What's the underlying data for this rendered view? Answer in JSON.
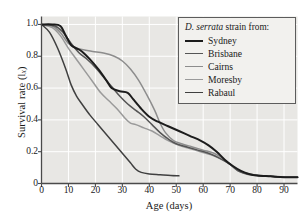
{
  "chart_data": {
    "type": "line",
    "title": "",
    "xlabel": "Age (days)",
    "ylabel": "Survival rate (l",
    "ylabel_sub": "x",
    "ylabel_suffix": ")",
    "xlim": [
      0,
      95
    ],
    "ylim": [
      0,
      1.05
    ],
    "xticks": [
      0,
      10,
      20,
      30,
      40,
      50,
      60,
      70,
      80,
      90
    ],
    "yticks": [
      0,
      0.2,
      0.4,
      0.6,
      0.8,
      1.0
    ],
    "ytick_labels": [
      "0",
      "0.2",
      "0.4",
      "0.6",
      "0.8",
      "1.0"
    ],
    "xtick_labels": [
      "0",
      "10",
      "20",
      "30",
      "40",
      "50",
      "60",
      "70",
      "80",
      "90"
    ],
    "grid": true,
    "grid_color": "#ffffff",
    "plot_background": "#e8e7e4",
    "legend_position": "upper-right",
    "series": [
      {
        "name": "Sydney",
        "color": "#1c1c1c",
        "width": 2.0,
        "points": [
          [
            0,
            1.0
          ],
          [
            4,
            1.0
          ],
          [
            7,
            0.99
          ],
          [
            9,
            0.93
          ],
          [
            11,
            0.87
          ],
          [
            13,
            0.85
          ],
          [
            15,
            0.83
          ],
          [
            18,
            0.78
          ],
          [
            21,
            0.72
          ],
          [
            24,
            0.65
          ],
          [
            26,
            0.6
          ],
          [
            29,
            0.58
          ],
          [
            32,
            0.57
          ],
          [
            34,
            0.53
          ],
          [
            37,
            0.47
          ],
          [
            40,
            0.42
          ],
          [
            43,
            0.39
          ],
          [
            47,
            0.36
          ],
          [
            51,
            0.33
          ],
          [
            55,
            0.3
          ],
          [
            59,
            0.27
          ],
          [
            62,
            0.24
          ],
          [
            65,
            0.2
          ],
          [
            68,
            0.15
          ],
          [
            71,
            0.11
          ],
          [
            74,
            0.08
          ],
          [
            77,
            0.06
          ],
          [
            80,
            0.05
          ],
          [
            85,
            0.045
          ],
          [
            90,
            0.04
          ],
          [
            95,
            0.04
          ]
        ]
      },
      {
        "name": "Brisbane",
        "color": "#555555",
        "width": 1.5,
        "points": [
          [
            0,
            1.0
          ],
          [
            5,
            0.99
          ],
          [
            8,
            0.95
          ],
          [
            11,
            0.88
          ],
          [
            14,
            0.82
          ],
          [
            17,
            0.78
          ],
          [
            20,
            0.73
          ],
          [
            23,
            0.67
          ],
          [
            26,
            0.61
          ],
          [
            29,
            0.55
          ],
          [
            32,
            0.5
          ],
          [
            35,
            0.46
          ],
          [
            38,
            0.42
          ],
          [
            41,
            0.37
          ],
          [
            44,
            0.32
          ],
          [
            47,
            0.28
          ],
          [
            50,
            0.25
          ],
          [
            54,
            0.23
          ],
          [
            58,
            0.21
          ],
          [
            62,
            0.19
          ],
          [
            66,
            0.16
          ],
          [
            70,
            0.12
          ],
          [
            73,
            0.08
          ],
          [
            76,
            0.06
          ],
          [
            80,
            0.05
          ],
          [
            85,
            0.045
          ],
          [
            90,
            0.04
          ],
          [
            95,
            0.04
          ]
        ]
      },
      {
        "name": "Cairns",
        "color": "#8d8d8d",
        "width": 1.5,
        "points": [
          [
            0,
            1.0
          ],
          [
            4,
            0.99
          ],
          [
            7,
            0.95
          ],
          [
            10,
            0.88
          ],
          [
            13,
            0.85
          ],
          [
            16,
            0.84
          ],
          [
            19,
            0.83
          ],
          [
            23,
            0.82
          ],
          [
            27,
            0.8
          ],
          [
            30,
            0.77
          ],
          [
            33,
            0.72
          ],
          [
            36,
            0.65
          ],
          [
            39,
            0.56
          ],
          [
            42,
            0.46
          ],
          [
            44,
            0.38
          ],
          [
            46,
            0.32
          ],
          [
            49,
            0.27
          ],
          [
            52,
            0.25
          ],
          [
            56,
            0.23
          ],
          [
            60,
            0.21
          ],
          [
            64,
            0.19
          ],
          [
            67,
            0.16
          ],
          [
            70,
            0.12
          ],
          [
            73,
            0.08
          ],
          [
            77,
            0.06
          ],
          [
            81,
            0.05
          ],
          [
            86,
            0.045
          ],
          [
            91,
            0.04
          ],
          [
            95,
            0.04
          ]
        ]
      },
      {
        "name": "Moresby",
        "color": "#9a9a9a",
        "width": 1.5,
        "points": [
          [
            0,
            1.0
          ],
          [
            4,
            0.98
          ],
          [
            7,
            0.93
          ],
          [
            10,
            0.85
          ],
          [
            13,
            0.78
          ],
          [
            16,
            0.71
          ],
          [
            19,
            0.64
          ],
          [
            22,
            0.57
          ],
          [
            25,
            0.52
          ],
          [
            28,
            0.47
          ],
          [
            31,
            0.41
          ],
          [
            33,
            0.38
          ],
          [
            35,
            0.37
          ],
          [
            38,
            0.35
          ],
          [
            41,
            0.33
          ],
          [
            44,
            0.3
          ],
          [
            47,
            0.27
          ],
          [
            51,
            0.24
          ],
          [
            55,
            0.22
          ],
          [
            59,
            0.2
          ],
          [
            63,
            0.18
          ],
          [
            67,
            0.15
          ],
          [
            70,
            0.12
          ],
          [
            73,
            0.08
          ],
          [
            77,
            0.06
          ],
          [
            81,
            0.05
          ],
          [
            86,
            0.045
          ],
          [
            91,
            0.04
          ],
          [
            95,
            0.04
          ]
        ]
      },
      {
        "name": "Rabaul",
        "color": "#404040",
        "width": 1.5,
        "points": [
          [
            0,
            1.0
          ],
          [
            3,
            0.95
          ],
          [
            6,
            0.85
          ],
          [
            9,
            0.72
          ],
          [
            11,
            0.62
          ],
          [
            13,
            0.55
          ],
          [
            15,
            0.5
          ],
          [
            18,
            0.43
          ],
          [
            21,
            0.37
          ],
          [
            24,
            0.31
          ],
          [
            27,
            0.25
          ],
          [
            30,
            0.19
          ],
          [
            33,
            0.13
          ],
          [
            35,
            0.09
          ],
          [
            37,
            0.07
          ],
          [
            40,
            0.06
          ],
          [
            44,
            0.055
          ],
          [
            48,
            0.05
          ],
          [
            51,
            0.048
          ]
        ]
      }
    ]
  },
  "legend": {
    "title_italic": "D. serrata",
    "title_rest": " strain from:",
    "items": [
      {
        "label": "Sydney",
        "color": "#1c1c1c",
        "width": "2.2px"
      },
      {
        "label": "Brisbane",
        "color": "#555555",
        "width": "1.6px"
      },
      {
        "label": "Cairns",
        "color": "#8d8d8d",
        "width": "1.6px"
      },
      {
        "label": "Moresby",
        "color": "#9a9a9a",
        "width": "1.6px"
      },
      {
        "label": "Rabaul",
        "color": "#404040",
        "width": "1.6px"
      }
    ]
  }
}
